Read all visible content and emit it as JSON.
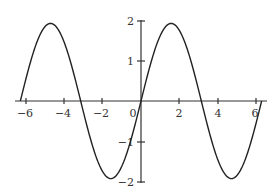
{
  "chart_data": {
    "type": "line",
    "title": "",
    "xlabel": "",
    "ylabel": "",
    "function": "y = 2 sin(x)",
    "xlim": [
      -6.6,
      6.6
    ],
    "ylim": [
      -2,
      2
    ],
    "grid": false,
    "legend": null,
    "x_ticks": [
      -6,
      -4,
      -2,
      0,
      2,
      4,
      6
    ],
    "x_tick_labels": [
      "-6",
      "-4",
      "-2",
      "0",
      "2",
      "4",
      "6"
    ],
    "y_ticks": [
      2,
      1,
      -1,
      -2
    ],
    "y_tick_labels": [
      "2",
      "1",
      "-1",
      "-2"
    ],
    "series": [
      {
        "name": "2 sin(x)",
        "color": "#222222",
        "x_range": [
          -6.2832,
          6.2832
        ],
        "x": [
          -6.2832,
          -5.4978,
          -4.7124,
          -3.927,
          -3.1416,
          -2.3562,
          -1.5708,
          -0.7854,
          0,
          0.7854,
          1.5708,
          2.3562,
          3.1416,
          3.927,
          4.7124,
          5.4978,
          6.2832
        ],
        "y": [
          0,
          1.414,
          2,
          1.414,
          0,
          -1.414,
          -2,
          -1.414,
          0,
          1.414,
          2,
          1.414,
          0,
          -1.414,
          -2,
          -1.414,
          0
        ]
      }
    ]
  },
  "layout": {
    "origin_px": [
      141,
      101
    ],
    "px_per_x_unit": 19.2,
    "px_per_y_unit": 40.2,
    "x_axis_px": [
      15,
      267
    ],
    "y_axis_px": [
      20,
      183
    ]
  },
  "labels": {
    "x_m6": "−6",
    "x_m4": "−4",
    "x_m2": "−2",
    "x_0": "0",
    "x_2": "2",
    "x_4": "4",
    "x_6": "6",
    "y_2": "2",
    "y_1": "1",
    "y_m1": "−1",
    "y_m2": "−2"
  }
}
